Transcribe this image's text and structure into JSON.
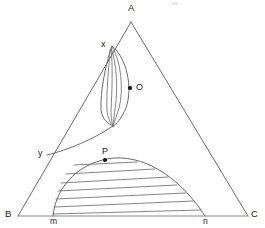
{
  "figure": {
    "background_color": "#ffffff",
    "line_color": "#6b6b6b",
    "baseline_color": "#8a8a8a",
    "hatch_color": "#6f6f6f",
    "marker_color": "#111111",
    "width": 265,
    "height": 228
  },
  "labels": {
    "vertex_a": "A",
    "vertex_b": "B",
    "vertex_c": "C",
    "point_x": "x",
    "point_y": "y",
    "point_m": "m",
    "point_n": "n",
    "point_o": "O",
    "point_p": "P"
  },
  "geometry": {
    "triangle": {
      "apex_a": [
        131,
        22
      ],
      "corner_b": [
        18,
        216
      ],
      "corner_c": [
        248,
        216
      ]
    },
    "baseline_points": {
      "m": [
        53,
        216
      ],
      "n": [
        205,
        216
      ]
    },
    "side_ab_points": {
      "x": [
        112,
        46
      ],
      "y": [
        47,
        155
      ]
    },
    "markers": {
      "o": [
        130,
        88
      ],
      "p": [
        105,
        160
      ]
    },
    "upper_region": {
      "name": "crescent-hatched-region",
      "apex": [
        112,
        46
      ],
      "tip": [
        113,
        126
      ],
      "hatch_line_count": 4,
      "hatch_direction": "fan-from-apex"
    },
    "lower_region": {
      "name": "dome-hatched-region",
      "left_foot": [
        53,
        216
      ],
      "right_foot": [
        205,
        216
      ],
      "crest": [
        118,
        158
      ],
      "hatch_line_count": 7,
      "hatch_direction": "near-horizontal"
    },
    "connector_curve": {
      "name": "y-to-crescent-curve",
      "from": [
        47,
        155
      ],
      "to": [
        113,
        126
      ]
    }
  }
}
